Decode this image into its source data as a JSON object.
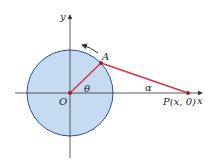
{
  "diagram": {
    "labels": {
      "y_axis": "y",
      "x_axis": "x",
      "point_a": "A",
      "origin": "O",
      "theta": "θ",
      "alpha": "α",
      "point_p": "P(x, 0)"
    },
    "colors": {
      "circle_fill": "#c5dbf1",
      "circle_stroke": "#2e4f8f",
      "segment": "#d6334a",
      "axis": "#333333",
      "point": "#a01e2e"
    }
  }
}
